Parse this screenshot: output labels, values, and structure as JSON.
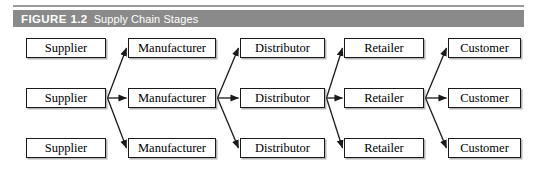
{
  "figure": {
    "label": "FIGURE 1.2",
    "title": "Supply Chain Stages",
    "header_bg": "#8a8a8a",
    "header_text_color": "#ffffff",
    "box_border_color": "#1a1a1a",
    "box_fill": "#ffffff",
    "arrow_color": "#1a1a1a"
  },
  "diagram": {
    "type": "flow-diagram",
    "stage_count": 5,
    "rows_per_stage": 3,
    "stages": [
      {
        "name": "Supplier",
        "labels": [
          "Supplier",
          "Supplier",
          "Supplier"
        ]
      },
      {
        "name": "Manufacturer",
        "labels": [
          "Manufacturer",
          "Manufacturer",
          "Manufacturer"
        ]
      },
      {
        "name": "Distributor",
        "labels": [
          "Distributor",
          "Distributor",
          "Distributor"
        ]
      },
      {
        "name": "Retailer",
        "labels": [
          "Retailer",
          "Retailer",
          "Retailer"
        ]
      },
      {
        "name": "Customer",
        "labels": [
          "Customer",
          "Customer",
          "Customer"
        ]
      }
    ],
    "flow_note": "From the middle box of each stage, three arrows fan out to the top, middle and bottom boxes of the next stage."
  }
}
